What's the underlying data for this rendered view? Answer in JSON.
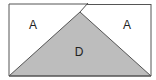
{
  "diagram": {
    "labels": {
      "left_region": "A",
      "right_region": "A",
      "triangle_region": "D"
    },
    "colors": {
      "stroke": "#444444",
      "triangle_fill": "#bdbdbd",
      "background": "#ffffff"
    }
  }
}
